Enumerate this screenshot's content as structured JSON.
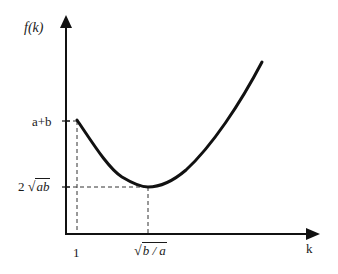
{
  "diagram": {
    "y_axis_label": "f(k)",
    "x_axis_label": "k",
    "y_ticks": [
      {
        "label": "a+b",
        "meaning": "f(1)"
      },
      {
        "label_prefix": "2",
        "label_radicand": "ab",
        "meaning": "minimum value"
      }
    ],
    "x_ticks": [
      {
        "label": "1"
      },
      {
        "label_radicand": "b / a",
        "meaning": "minimizer"
      }
    ],
    "curve": {
      "description": "Convex curve starting at (1, a+b), decreasing to minimum (sqrt(b/a), 2 sqrt(ab)), then increasing",
      "stroke_color": "#111111"
    },
    "guides": {
      "style": "dashed",
      "color": "#333333"
    }
  }
}
